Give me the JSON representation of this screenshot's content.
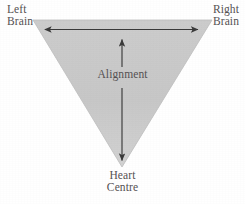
{
  "figure": {
    "shape": "inverted-triangle",
    "fill_color": "#c8c8c8",
    "edge_color": "#b4b4b4",
    "background_color": "#ffffff",
    "arrow_color": "#3a3a3a",
    "text_color": "#555153",
    "vertices": {
      "top_left": [
        33,
        20
      ],
      "top_right": [
        212,
        20
      ],
      "bottom": [
        122,
        167
      ]
    },
    "arrows": [
      {
        "name": "horizontal-alignment-arrow",
        "heads": "both",
        "from": [
          44,
          29
        ],
        "to": [
          199,
          29
        ]
      },
      {
        "name": "vertical-up-alignment-arrow",
        "heads": "start",
        "from": [
          122,
          67
        ],
        "to": [
          122,
          38
        ]
      },
      {
        "name": "vertical-down-alignment-arrow",
        "heads": "end",
        "from": [
          122,
          88
        ],
        "to": [
          122,
          162
        ]
      }
    ]
  },
  "labels": {
    "left_brain": {
      "line1": "Left",
      "line2": "Brain"
    },
    "right_brain": {
      "line1": "Right",
      "line2": "Brain"
    },
    "center": {
      "line1": "Alignment"
    },
    "heart_centre": {
      "line1": "Heart",
      "line2": "Centre"
    }
  }
}
